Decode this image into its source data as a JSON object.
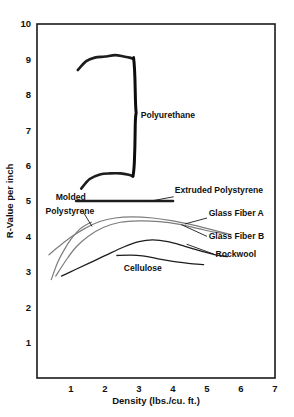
{
  "chart_data": {
    "type": "line",
    "title": "",
    "xlabel": "Density (lbs./cu. ft.)",
    "ylabel": "R-Value per inch",
    "xlim": [
      0,
      7
    ],
    "ylim": [
      0,
      10
    ],
    "grid": true,
    "legend_position": "inline-annotations",
    "xticks": [
      "1",
      "2",
      "3",
      "4",
      "5",
      "6",
      "7"
    ],
    "xtick_values": [
      1,
      2,
      3,
      4,
      5,
      6,
      7
    ],
    "yticks": [
      "1",
      "2",
      "3",
      "4",
      "5",
      "6",
      "7",
      "8",
      "9",
      "10"
    ],
    "ytick_values": [
      1,
      2,
      3,
      4,
      5,
      6,
      7,
      8,
      9,
      10
    ],
    "series": [
      {
        "name": "Polyurethane (upper bound)",
        "label": "Polyurethane",
        "style": "dark-thick",
        "points": [
          [
            1.2,
            8.7
          ],
          [
            1.45,
            8.95
          ],
          [
            1.7,
            9.05
          ],
          [
            2.0,
            9.08
          ],
          [
            2.3,
            9.12
          ],
          [
            2.55,
            9.08
          ],
          [
            2.72,
            9.05
          ],
          [
            2.82,
            9.02
          ]
        ]
      },
      {
        "name": "Polyurethane (lower bound)",
        "label": "Polyurethane",
        "style": "dark-thick",
        "points": [
          [
            1.3,
            5.35
          ],
          [
            1.55,
            5.62
          ],
          [
            1.85,
            5.75
          ],
          [
            2.15,
            5.78
          ],
          [
            2.45,
            5.78
          ],
          [
            2.7,
            5.74
          ],
          [
            2.82,
            5.7
          ]
        ]
      },
      {
        "name": "Polyurethane (range brace)",
        "label": "Polyurethane",
        "style": "brace",
        "points": [
          [
            2.84,
            9.05
          ],
          [
            2.84,
            5.7
          ]
        ]
      },
      {
        "name": "Extruded Polystyrene",
        "label": "Extruded Polystyrene",
        "style": "dark-thick",
        "points": [
          [
            1.15,
            5.0
          ],
          [
            2.5,
            5.0
          ],
          [
            4.0,
            5.0
          ]
        ]
      },
      {
        "name": "Molded Polystyrene",
        "label": "Molded Polystyrene",
        "style": "gray",
        "points": [
          [
            0.42,
            2.78
          ],
          [
            0.6,
            3.25
          ],
          [
            0.8,
            3.62
          ],
          [
            1.0,
            3.92
          ],
          [
            1.25,
            4.2
          ],
          [
            1.45,
            4.33
          ],
          [
            1.6,
            4.4
          ]
        ]
      },
      {
        "name": "Glass Fiber A",
        "label": "Glass Fiber A",
        "style": "gray",
        "points": [
          [
            0.35,
            3.48
          ],
          [
            0.65,
            3.72
          ],
          [
            1.0,
            3.98
          ],
          [
            1.4,
            4.22
          ],
          [
            1.85,
            4.42
          ],
          [
            2.3,
            4.52
          ],
          [
            2.8,
            4.55
          ],
          [
            3.4,
            4.52
          ],
          [
            4.0,
            4.44
          ],
          [
            4.6,
            4.32
          ],
          [
            5.1,
            4.2
          ],
          [
            5.5,
            4.1
          ],
          [
            5.7,
            4.05
          ]
        ]
      },
      {
        "name": "Glass Fiber B",
        "label": "Glass Fiber B",
        "style": "gray",
        "points": [
          [
            0.55,
            2.88
          ],
          [
            0.85,
            3.32
          ],
          [
            1.15,
            3.7
          ],
          [
            1.5,
            4.0
          ],
          [
            1.95,
            4.25
          ],
          [
            2.45,
            4.4
          ],
          [
            3.0,
            4.44
          ],
          [
            3.6,
            4.42
          ],
          [
            4.2,
            4.34
          ],
          [
            4.75,
            4.22
          ],
          [
            5.2,
            4.12
          ],
          [
            5.55,
            4.08
          ]
        ]
      },
      {
        "name": "Cellulose",
        "label": "Cellulose",
        "style": "dark",
        "points": [
          [
            0.72,
            2.88
          ],
          [
            1.1,
            3.05
          ],
          [
            1.55,
            3.25
          ],
          [
            2.05,
            3.48
          ],
          [
            2.55,
            3.7
          ],
          [
            3.0,
            3.85
          ],
          [
            3.4,
            3.9
          ],
          [
            3.85,
            3.85
          ],
          [
            4.35,
            3.72
          ],
          [
            4.85,
            3.58
          ],
          [
            5.25,
            3.48
          ],
          [
            5.6,
            3.43
          ]
        ]
      },
      {
        "name": "Rockwool",
        "label": "Rockwool",
        "style": "dark",
        "points": [
          [
            2.35,
            3.46
          ],
          [
            2.75,
            3.47
          ],
          [
            3.1,
            3.45
          ],
          [
            3.5,
            3.38
          ],
          [
            3.95,
            3.3
          ],
          [
            4.45,
            3.24
          ],
          [
            4.9,
            3.2
          ]
        ]
      }
    ],
    "annotations": [
      {
        "text": "Polyurethane",
        "x": 3.05,
        "y": 7.35
      },
      {
        "text": "Extruded Polystyrene",
        "x": 4.05,
        "y": 5.22
      },
      {
        "text": "Molded",
        "x": 0.55,
        "y": 5.02
      },
      {
        "text": "Polystyrene",
        "x": 0.25,
        "y": 4.62
      },
      {
        "text": "Glass Fiber A",
        "x": 5.05,
        "y": 4.58
      },
      {
        "text": "Glass Fiber B",
        "x": 5.05,
        "y": 3.92
      },
      {
        "text": "Rockwool",
        "x": 5.25,
        "y": 3.42
      },
      {
        "text": "Cellulose",
        "x": 2.55,
        "y": 3.02
      }
    ]
  },
  "axes": {
    "x_title": "Density (lbs./cu. ft.)",
    "y_title": "R-Value per inch",
    "x_tick_labels": [
      "1",
      "2",
      "3",
      "4",
      "5",
      "6",
      "7"
    ],
    "y_tick_labels": [
      "10",
      "9",
      "8",
      "7",
      "6",
      "5",
      "4",
      "3",
      "2",
      "1"
    ]
  },
  "colors": {
    "dark_curve": "#1d1d1d",
    "gray_curve": "#7d7d7d",
    "mid_curve": "#4a4a4a",
    "gridline": "#9a9a9a",
    "frame": "#1a1a1a",
    "background": "#ffffff",
    "text": "#111111"
  }
}
